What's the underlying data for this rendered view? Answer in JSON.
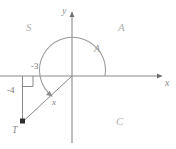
{
  "figure": {
    "type": "coordinate-plane-angle-diagram",
    "background_color": "#ffffff",
    "line_color": "#8a8a8a",
    "text_color": "#9a9a9a",
    "axes": {
      "x_label": "x",
      "y_label": "y",
      "origin_x": 72,
      "origin_y": 76
    },
    "quadrant_labels": {
      "upper_left": "S",
      "upper_right": "A",
      "lower_right": "C",
      "lower_left": "T"
    },
    "angle": {
      "label": "A",
      "start_degrees": 0,
      "end_degrees": 233,
      "direction": "counterclockwise",
      "arrow": "terminal"
    },
    "point": {
      "label": "T",
      "x_value": "-3",
      "y_value": "-4"
    },
    "triangle": {
      "horizontal_leg_label": "-3",
      "vertical_leg_label": "-4",
      "hypotenuse_label": "x",
      "right_angle_marker": true
    }
  }
}
